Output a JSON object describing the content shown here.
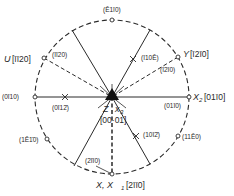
{
  "diagram": {
    "type": "stereographic-projection",
    "colors": {
      "ink": "#2a2a2a",
      "background": "#ffffff"
    },
    "center_label": {
      "axis": "Z",
      "axis2": "X3",
      "index": "[0001]"
    },
    "axes": {
      "x": {
        "label": "X, X1",
        "index": "[2110]",
        "index_display": "[2̄ī1̄0]"
      },
      "x2": {
        "label": "X2",
        "index": "[0110]",
        "index_display": "[01̄1̄0]"
      },
      "y": {
        "label": "Y",
        "index": "[1210]",
        "index_display": "[ī2ī0]"
      },
      "u": {
        "label": "U",
        "index": "[1120]",
        "index_display": "[īī20]"
      }
    },
    "poles": [
      {
        "name": "pole-top",
        "label": "(̅2110)",
        "display": "(Ē1ī0)"
      },
      {
        "name": "pole-u",
        "label": "(īī20)"
      },
      {
        "name": "pole-left",
        "label": "(0ī10)"
      },
      {
        "name": "pole-0112",
        "label": "(0ī12̄)"
      },
      {
        "name": "pole-1210",
        "label": "(1Ē1̄0)"
      },
      {
        "name": "pole-2110-inner",
        "label": "(2īī0)"
      },
      {
        "name": "pole-1012",
        "label": "(10ī2̄)"
      },
      {
        "name": "pole-1120",
        "label": "(11Ē0)"
      },
      {
        "name": "pole-01-10",
        "label": "(01ī0)"
      },
      {
        "name": "pole-y-inner",
        "label": "(ī2ī0)"
      },
      {
        "name": "pole-1102",
        "label": "(ī10Ē)"
      }
    ],
    "texts": {
      "top": "(Ē1ī0)",
      "u_label": "U",
      "u_index": "[īī20]",
      "u_inner": "(īī20)",
      "left": "(0ī10)",
      "x_0112": "(0ī12̄)",
      "p1210": "(1Ē1̄0)",
      "p2110": "(2īī0)",
      "x_label": "X, X",
      "x_sub": "1",
      "x_index": "[2īī0]",
      "p1012": "(10ī2̄)",
      "p1120": "(11Ē0)",
      "p0110": "(01ī0)",
      "x2_label": "X",
      "x2_sub": "2",
      "x2_index": "[01ī0]",
      "y_label": "Y",
      "y_index": "[ī2ī0]",
      "y_inner": "(ī2ī0)",
      "p1102": "(ī10Ē)",
      "z_label": "Z",
      "x3_label": "x",
      "x3_sub": "3",
      "center_index": "[00·01]"
    }
  }
}
